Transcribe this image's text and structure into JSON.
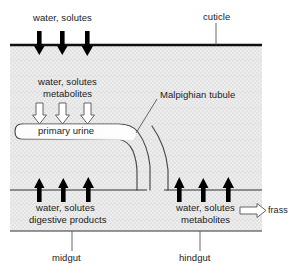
{
  "diagram": {
    "title_labels": {
      "cuticle": "cuticle",
      "malpighian_tubule": "Malpighian tubule",
      "primary_urine": "primary urine",
      "midgut": "midgut",
      "hindgut": "hindgut",
      "frass": "frass"
    },
    "flux_labels": {
      "top_line1": "water, solutes",
      "tubule_line1": "water, solutes",
      "tubule_line2": "metabolites",
      "midgut_line1": "water, solutes",
      "midgut_line2": "digestive products",
      "hindgut_line1": "water, solutes",
      "hindgut_line2": "metabolites"
    },
    "icons": {
      "arrow_down_solid": "arrow-down-solid-icon",
      "arrow_down_hollow": "arrow-down-hollow-icon",
      "arrow_up_solid": "arrow-up-solid-icon",
      "arrow_right_hollow": "arrow-right-hollow-icon"
    },
    "colors": {
      "line": "#1a1a1a",
      "body_fill": "#ebebeb",
      "tubule_fill": "#ffffff",
      "arrow_solid": "#000000",
      "arrow_hollow_fill": "#ffffff",
      "leader": "#555555",
      "text": "#1a1a1a"
    }
  }
}
